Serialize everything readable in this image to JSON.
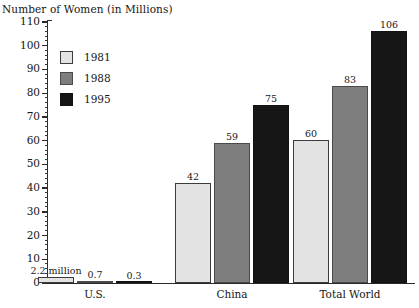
{
  "chart_data": {
    "type": "bar",
    "title": "",
    "xlabel": "",
    "ylabel": "Number of Women (in Millions)",
    "ylim": [
      0,
      110
    ],
    "y_tick_step": 10,
    "y_minor_step": 2,
    "grid": false,
    "legend_position": "upper-left-inside",
    "categories": [
      "U.S.",
      "China",
      "Total World"
    ],
    "series": [
      {
        "name": "1981",
        "color": "#e3e3e3",
        "values": [
          2.2,
          42,
          60
        ],
        "value_labels": [
          "2.2 million",
          "42",
          "60"
        ]
      },
      {
        "name": "1988",
        "color": "#7e7e7e",
        "values": [
          0.7,
          59,
          83
        ],
        "value_labels": [
          "0.7",
          "59",
          "83"
        ]
      },
      {
        "name": "1995",
        "color": "#161616",
        "values": [
          0.3,
          75,
          106
        ],
        "value_labels": [
          "0.3",
          "75",
          "106"
        ]
      }
    ],
    "y_tick_labels": [
      "0",
      "10",
      "20",
      "30",
      "40",
      "50",
      "60",
      "70",
      "80",
      "90",
      "100",
      "110"
    ]
  },
  "axis": {
    "y_title": "Number of Women (in Millions)",
    "ticks": [
      {
        "label": "110"
      },
      {
        "label": "100"
      },
      {
        "label": "90"
      },
      {
        "label": "80"
      },
      {
        "label": "70"
      },
      {
        "label": "60"
      },
      {
        "label": "50"
      },
      {
        "label": "40"
      },
      {
        "label": "30"
      },
      {
        "label": "20"
      },
      {
        "label": "10"
      },
      {
        "label": "0"
      }
    ]
  },
  "legend": {
    "entries": [
      {
        "label": "1981",
        "swatch": "light-gray-swatch"
      },
      {
        "label": "1988",
        "swatch": "medium-gray-swatch"
      },
      {
        "label": "1995",
        "swatch": "black-swatch"
      }
    ]
  },
  "categories": [
    {
      "label": "U.S."
    },
    {
      "label": "China"
    },
    {
      "label": "Total World"
    }
  ],
  "bars": [
    {
      "label": "2.2 million"
    },
    {
      "label": "0.7"
    },
    {
      "label": "0.3"
    },
    {
      "label": "42"
    },
    {
      "label": "59"
    },
    {
      "label": "75"
    },
    {
      "label": "60"
    },
    {
      "label": "83"
    },
    {
      "label": "106"
    }
  ]
}
